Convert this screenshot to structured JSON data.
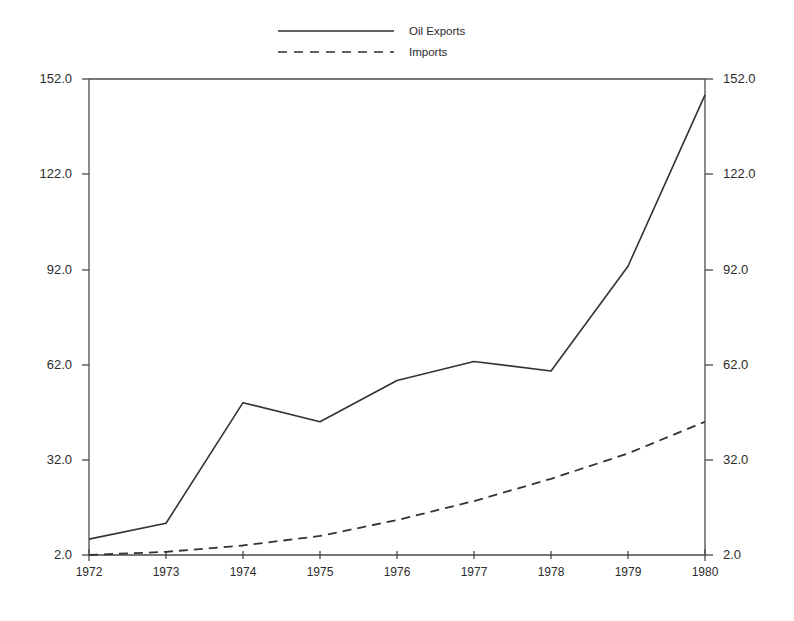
{
  "chart_data": {
    "type": "line",
    "title": "",
    "subtitle": "",
    "xlabel": "",
    "ylabel": "",
    "x": [
      1972,
      1973,
      1974,
      1975,
      1976,
      1977,
      1978,
      1979,
      1980
    ],
    "categories": [
      "1972",
      "1973",
      "1974",
      "1975",
      "1976",
      "1977",
      "1978",
      "1979",
      "1980"
    ],
    "series": [
      {
        "name": "Oil Exports",
        "style": "solid",
        "color": "#333333",
        "values": [
          7,
          12,
          50,
          44,
          57,
          63,
          60,
          93,
          147
        ]
      },
      {
        "name": "Imports",
        "style": "dashed",
        "color": "#333333",
        "values": [
          2,
          3,
          5,
          8,
          13,
          19,
          26,
          34,
          44
        ]
      }
    ],
    "xlim": [
      1972,
      1980
    ],
    "ylim": [
      2.0,
      152.0
    ],
    "yticks": [
      2.0,
      32.0,
      62.0,
      92.0,
      122.0,
      152.0
    ],
    "ytick_labels": [
      "2.0",
      "32.0",
      "62.0",
      "92.0",
      "122.0",
      "152.0"
    ],
    "xtick_labels": [
      "1972",
      "1973",
      "1974",
      "1975",
      "1976",
      "1977",
      "1978",
      "1979",
      "1980"
    ],
    "grid": false,
    "legend_position": "top-center",
    "axis_left_labels": [
      "152.0",
      "122.0",
      "92.0",
      "62.0",
      "32.0",
      "2.0"
    ],
    "axis_right_labels": [
      "152.0",
      "122.0",
      "92.0",
      "62.0",
      "32.0",
      "2.0"
    ]
  },
  "legend": {
    "entries": [
      {
        "label": "Oil Exports",
        "style": "solid"
      },
      {
        "label": "Imports",
        "style": "dashed"
      }
    ]
  },
  "axes": {
    "left": {
      "ticks": [
        "152.0",
        "122.0",
        "92.0",
        "62.0",
        "32.0",
        "2.0"
      ]
    },
    "right": {
      "ticks": [
        "152.0",
        "122.0",
        "92.0",
        "62.0",
        "32.0",
        "2.0"
      ]
    },
    "bottom": {
      "ticks": [
        "1972",
        "1973",
        "1974",
        "1975",
        "1976",
        "1977",
        "1978",
        "1979",
        "1980"
      ]
    }
  }
}
